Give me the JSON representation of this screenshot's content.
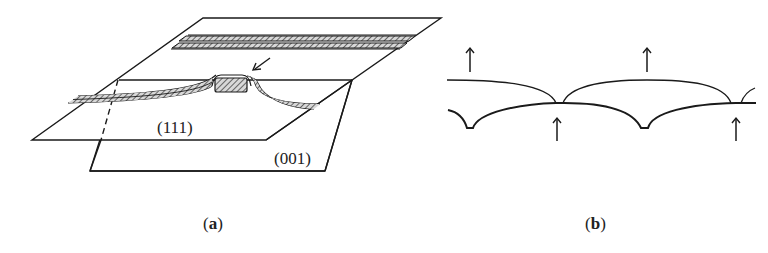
{
  "figure": {
    "panels": [
      {
        "id": "a",
        "caption_open": "(",
        "caption_letter": "a",
        "caption_close": ")",
        "planes": [
          {
            "name": "upper-plane",
            "label": "(111)"
          },
          {
            "name": "lower-plane",
            "label": "(001)"
          }
        ],
        "annotations": [
          "arrow pointing to step"
        ]
      },
      {
        "id": "b",
        "caption_open": "(",
        "caption_letter": "b",
        "caption_close": ")",
        "arrows": [
          {
            "direction": "up",
            "position": "above-upper-curve-left"
          },
          {
            "direction": "up",
            "position": "above-upper-curve-right"
          },
          {
            "direction": "up",
            "position": "below-lower-curve-cusp-1"
          },
          {
            "direction": "up",
            "position": "below-lower-curve-cusp-2"
          }
        ]
      }
    ],
    "colors": {
      "line": "#1a1a1a",
      "hatch": "#555555",
      "text": "#222222"
    }
  }
}
